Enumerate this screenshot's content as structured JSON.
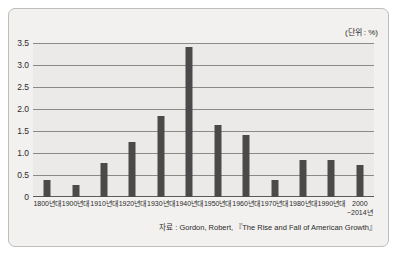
{
  "card": {
    "unit_label": "(단위 : %)",
    "source_note": "자료 : Gordon, Robert, 『The Rise and Fall of American Growth』"
  },
  "style": {
    "bar_color": "#4a4a4a",
    "plot_background": "#eceae8",
    "card_background": "#f2f1ef",
    "gridline_color": "#8d8a86",
    "text_color": "#2b2b2b"
  },
  "chart_data": {
    "type": "bar",
    "title": "",
    "subtitle": "",
    "xlabel": "",
    "ylabel": "",
    "unit": "%",
    "ylim": [
      0,
      3.5
    ],
    "yticks": [
      0,
      0.5,
      1.0,
      1.5,
      2.0,
      2.5,
      3.0,
      3.5
    ],
    "ytick_labels": [
      "0",
      "0.5",
      "1.0",
      "1.5",
      "2.0",
      "2.5",
      "3.0",
      "3.5"
    ],
    "grid": true,
    "legend": "none",
    "categories": [
      "1800년대",
      "1900년대",
      "1910년대",
      "1920년대",
      "1930년대",
      "1940년대",
      "1950년대",
      "1960년대",
      "1970년대",
      "1980년대",
      "1990년대",
      "2000\n~2014년"
    ],
    "values": [
      0.38,
      0.27,
      0.77,
      1.25,
      1.84,
      3.4,
      1.63,
      1.42,
      0.38,
      0.83,
      0.83,
      0.73
    ],
    "annotations": [
      "(단위 : %)",
      "자료 : Gordon, Robert, 『The Rise and Fall of American Growth』"
    ]
  }
}
